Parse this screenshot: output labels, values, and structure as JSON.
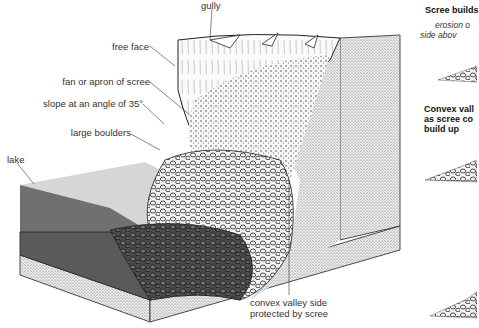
{
  "diagram": {
    "labels": {
      "gully": "gully",
      "free_face": "free face",
      "fan": "fan or apron of scree",
      "slope": "slope at an angle of 35°",
      "boulders": "large boulders",
      "lake": "lake",
      "convex_line1": "convex valley side",
      "convex_line2": "protected by scree"
    }
  },
  "sidebar": {
    "panel1": {
      "title": "Scree builds",
      "note_line1": "erosion o",
      "note_line2": "side abov"
    },
    "panel2": {
      "title_line1": "Convex vall",
      "title_line2": "as scree co",
      "title_line3": "build up"
    }
  },
  "colors": {
    "rock_stipple": "#cfcfcf",
    "lake_surface": "#d4d4d4",
    "lake_front": "#6e6e6e",
    "lake_bed": "#5a5a5a",
    "outline": "#222222"
  }
}
